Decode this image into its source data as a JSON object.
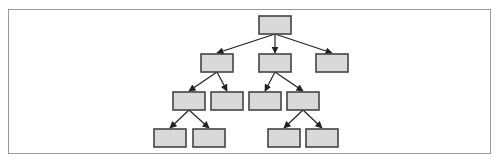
{
  "diagram": {
    "type": "tree",
    "frame": {
      "x": 8,
      "y": 9,
      "width": 483,
      "height": 145,
      "border_color": "#9a9a9a"
    },
    "node_style": {
      "fill": "#d9d9d9",
      "stroke": "#444444",
      "width": 32,
      "height": 18
    },
    "edge_style": {
      "stroke": "#222222",
      "arrowhead": "filled"
    },
    "nodes": [
      {
        "id": "root",
        "label": "",
        "x": 259,
        "y": 16,
        "level": 1
      },
      {
        "id": "n1",
        "label": "",
        "x": 201,
        "y": 54,
        "level": 2
      },
      {
        "id": "n2",
        "label": "",
        "x": 259,
        "y": 54,
        "level": 2
      },
      {
        "id": "n3",
        "label": "",
        "x": 316,
        "y": 54,
        "level": 2
      },
      {
        "id": "n1a",
        "label": "",
        "x": 173,
        "y": 92,
        "level": 3
      },
      {
        "id": "n1b",
        "label": "",
        "x": 211,
        "y": 92,
        "level": 3
      },
      {
        "id": "n2a",
        "label": "",
        "x": 249,
        "y": 92,
        "level": 3
      },
      {
        "id": "n2b",
        "label": "",
        "x": 287,
        "y": 92,
        "level": 3
      },
      {
        "id": "n1a1",
        "label": "",
        "x": 154,
        "y": 129,
        "level": 4
      },
      {
        "id": "n1a2",
        "label": "",
        "x": 193,
        "y": 129,
        "level": 4
      },
      {
        "id": "n2b1",
        "label": "",
        "x": 268,
        "y": 129,
        "level": 4
      },
      {
        "id": "n2b2",
        "label": "",
        "x": 306,
        "y": 129,
        "level": 4
      }
    ],
    "edges": [
      {
        "from": "root",
        "to": "n1"
      },
      {
        "from": "root",
        "to": "n2"
      },
      {
        "from": "root",
        "to": "n3"
      },
      {
        "from": "n1",
        "to": "n1a"
      },
      {
        "from": "n1",
        "to": "n1b"
      },
      {
        "from": "n2",
        "to": "n2a"
      },
      {
        "from": "n2",
        "to": "n2b"
      },
      {
        "from": "n1a",
        "to": "n1a1"
      },
      {
        "from": "n1a",
        "to": "n1a2"
      },
      {
        "from": "n2b",
        "to": "n2b1"
      },
      {
        "from": "n2b",
        "to": "n2b2"
      }
    ]
  }
}
